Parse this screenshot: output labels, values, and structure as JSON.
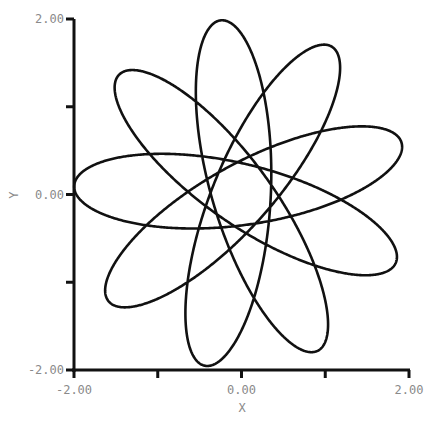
{
  "chart_data": {
    "type": "line",
    "title": "",
    "xlabel": "X",
    "ylabel": "Y",
    "xlim": [
      -2.0,
      2.0
    ],
    "ylim": [
      -2.0,
      2.0
    ],
    "grid": false,
    "legend": "none",
    "x_ticks": [
      -2.0,
      -1.0,
      0.0,
      1.0,
      2.0
    ],
    "y_ticks": [
      -2.0,
      -1.0,
      0.0,
      1.0,
      2.0
    ],
    "x_tick_labels": [
      {
        "value": -2.0,
        "label": "-2.00"
      },
      {
        "value": 0.0,
        "label": "0.00"
      },
      {
        "value": 2.0,
        "label": "2.00"
      }
    ],
    "y_tick_labels": [
      {
        "value": 2.0,
        "label": "2.00"
      },
      {
        "value": 0.0,
        "label": "0.00"
      },
      {
        "value": -2.0,
        "label": "-2.00"
      }
    ],
    "series": [
      {
        "name": "precessing-orbit",
        "color": "#111111",
        "description": "Rosette of a precessing ellipse: outer radius ~2.0, inner hole radius ~0.35",
        "model": {
          "outer_radius": 2.0,
          "inner_radius": 0.35,
          "loops": 9,
          "precession_turns": 1
        }
      }
    ]
  }
}
